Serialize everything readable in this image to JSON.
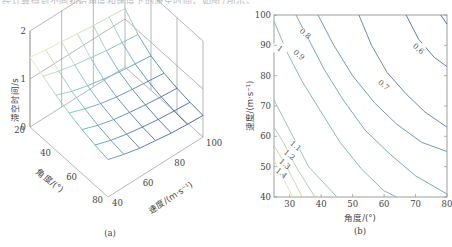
{
  "top_caption": "经计算得到不同初始角度和速度下的滞空时间，如图7所示。",
  "chart_data": [
    {
      "type": "surface",
      "panel_label": "(a)",
      "title": "",
      "xlabel": "速度/(m·s⁻¹)",
      "ylabel": "角度/(°)",
      "zlabel": "滞空时间/s",
      "x_ticks": [
        "40",
        "60",
        "80",
        "100"
      ],
      "y_ticks": [
        "20",
        "40",
        "60",
        "80"
      ],
      "z_ticks": [
        "0",
        "1",
        "2"
      ],
      "xlim": [
        40,
        100
      ],
      "ylim": [
        20,
        80
      ],
      "zlim": [
        0,
        2
      ],
      "grid": true,
      "x": [
        40,
        50,
        60,
        70,
        80,
        90,
        100
      ],
      "y": [
        20,
        30,
        40,
        50,
        60,
        70,
        80
      ],
      "z": [
        [
          1.45,
          1.4,
          1.36,
          1.32,
          1.28,
          1.25,
          1.22
        ],
        [
          1.3,
          1.2,
          1.12,
          1.06,
          1.0,
          0.96,
          0.92
        ],
        [
          1.15,
          1.02,
          0.93,
          0.86,
          0.8,
          0.76,
          0.72
        ],
        [
          1.02,
          0.9,
          0.8,
          0.73,
          0.68,
          0.64,
          0.6
        ],
        [
          0.92,
          0.8,
          0.71,
          0.65,
          0.6,
          0.56,
          0.53
        ],
        [
          0.84,
          0.73,
          0.65,
          0.59,
          0.54,
          0.51,
          0.48
        ],
        [
          0.78,
          0.68,
          0.6,
          0.55,
          0.5,
          0.47,
          0.45
        ]
      ]
    },
    {
      "type": "contour",
      "panel_label": "(b)",
      "title": "",
      "xlabel": "角度/(°)",
      "ylabel": "速度/(m·s⁻¹)",
      "x_ticks": [
        "30",
        "40",
        "50",
        "60",
        "70",
        "80"
      ],
      "y_ticks": [
        "40",
        "50",
        "60",
        "70",
        "80",
        "90",
        "100"
      ],
      "xlim": [
        25,
        80
      ],
      "ylim": [
        40,
        100
      ],
      "grid": false,
      "levels": [
        {
          "value": 1.4,
          "label": "1.4",
          "points": [
            [
              25,
              52
            ],
            [
              28,
              46
            ],
            [
              31,
              40
            ]
          ],
          "label_at": [
            27.5,
            48
          ]
        },
        {
          "value": 1.3,
          "label": "1.3",
          "points": [
            [
              25,
              57
            ],
            [
              29,
              50
            ],
            [
              34,
              40
            ]
          ],
          "label_at": [
            28.5,
            51
          ]
        },
        {
          "value": 1.2,
          "label": "1.2",
          "points": [
            [
              25,
              63
            ],
            [
              28,
              58
            ],
            [
              32,
              50
            ],
            [
              38,
              40
            ]
          ],
          "label_at": [
            30,
            54
          ]
        },
        {
          "value": 1.1,
          "label": "1.1",
          "points": [
            [
              25,
              72
            ],
            [
              28,
              66
            ],
            [
              31,
              60
            ],
            [
              36,
              50
            ],
            [
              45,
              40
            ]
          ],
          "label_at": [
            32,
            57
          ]
        },
        {
          "value": 1.0,
          "label": "1",
          "points": [
            [
              25,
              98
            ],
            [
              29,
              88
            ],
            [
              34,
              78
            ],
            [
              40,
              68
            ],
            [
              46,
              58
            ],
            [
              53,
              49
            ],
            [
              60,
              42
            ],
            [
              64,
              40
            ]
          ],
          "label_at": [
            27,
            89
          ]
        },
        {
          "value": 0.9,
          "label": "0.9",
          "points": [
            [
              32,
              100
            ],
            [
              36,
              92
            ],
            [
              41,
              82
            ],
            [
              47,
              72
            ],
            [
              54,
              62
            ],
            [
              62,
              54
            ],
            [
              70,
              47
            ],
            [
              80,
              41
            ]
          ],
          "label_at": [
            33,
            87
          ]
        },
        {
          "value": 0.8,
          "label": "0.8",
          "points": [
            [
              39,
              100
            ],
            [
              44,
              90
            ],
            [
              50,
              80
            ],
            [
              57,
              71
            ],
            [
              64,
              64
            ],
            [
              72,
              58
            ],
            [
              80,
              55
            ]
          ],
          "label_at": [
            35,
            94
          ]
        },
        {
          "value": 0.7,
          "label": "0.7",
          "points": [
            [
              52,
              100
            ],
            [
              56,
              90
            ],
            [
              61,
              81
            ],
            [
              67,
              74
            ],
            [
              73,
              68
            ],
            [
              80,
              63
            ]
          ],
          "label_at": [
            60,
            77
          ]
        },
        {
          "value": 0.6,
          "label": "0.6",
          "points": [
            [
              67,
              100
            ],
            [
              71,
              92
            ],
            [
              76,
              86
            ],
            [
              80,
              83
            ]
          ],
          "label_at": [
            71,
            89
          ]
        },
        {
          "value": 0.5,
          "label": "",
          "points": [
            [
              78,
              100
            ],
            [
              80,
              97
            ]
          ],
          "label_at": null
        }
      ],
      "colormap": "parula (yellow at high values, blue at low values)"
    }
  ]
}
